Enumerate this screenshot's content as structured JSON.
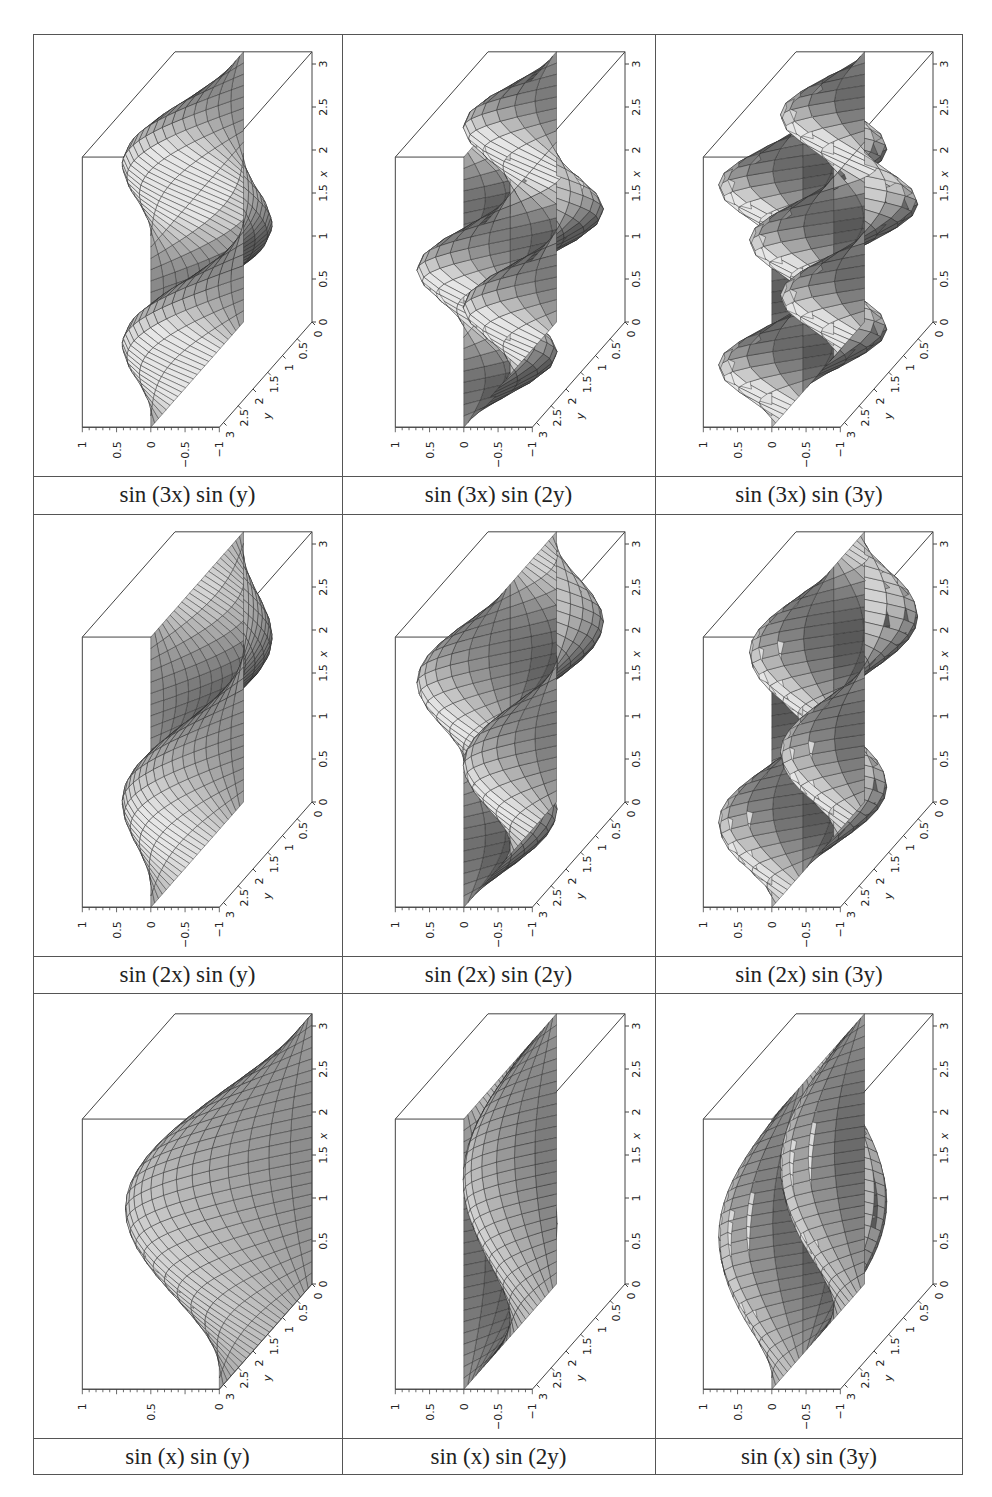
{
  "figure": {
    "layout": {
      "rows": 3,
      "cols": 3
    },
    "cells": [
      {
        "row": 0,
        "col": 0,
        "m": 3,
        "n": 1,
        "caption": "sin (3x) sin (y)",
        "zlim": [
          -1,
          1
        ]
      },
      {
        "row": 0,
        "col": 1,
        "m": 3,
        "n": 2,
        "caption": "sin (3x) sin (2y)",
        "zlim": [
          -1,
          1
        ]
      },
      {
        "row": 0,
        "col": 2,
        "m": 3,
        "n": 3,
        "caption": "sin (3x) sin (3y)",
        "zlim": [
          -1,
          1
        ]
      },
      {
        "row": 1,
        "col": 0,
        "m": 2,
        "n": 1,
        "caption": "sin (2x) sin (y)",
        "zlim": [
          -1,
          1
        ]
      },
      {
        "row": 1,
        "col": 1,
        "m": 2,
        "n": 2,
        "caption": "sin (2x) sin (2y)",
        "zlim": [
          -1,
          1
        ]
      },
      {
        "row": 1,
        "col": 2,
        "m": 2,
        "n": 3,
        "caption": "sin (2x) sin (3y)",
        "zlim": [
          -1,
          1
        ]
      },
      {
        "row": 2,
        "col": 0,
        "m": 1,
        "n": 1,
        "caption": "sin (x) sin (y)",
        "zlim": [
          0,
          1
        ]
      },
      {
        "row": 2,
        "col": 1,
        "m": 1,
        "n": 2,
        "caption": "sin (x) sin (2y)",
        "zlim": [
          -1,
          1
        ]
      },
      {
        "row": 2,
        "col": 2,
        "m": 1,
        "n": 3,
        "caption": "sin (x) sin (3y)",
        "zlim": [
          -1,
          1
        ]
      }
    ]
  },
  "chart_data": {
    "type": "surface-grid",
    "title": "",
    "function_family": "z = sin(m x) sin(n y)",
    "domain": {
      "x": [
        0,
        3.14159
      ],
      "y": [
        0,
        3.14159
      ]
    },
    "xlabel": "x",
    "ylabel": "y",
    "zlabel": "",
    "x_ticks": [
      "0",
      "0.5",
      "1",
      "1.5",
      "2",
      "2.5",
      "3"
    ],
    "y_ticks": [
      "0",
      "0.5",
      "1",
      "1.5",
      "2",
      "2.5",
      "3"
    ],
    "z_ticks_default": [
      "-1",
      "-0.5",
      "0",
      "0.5",
      "1"
    ],
    "z_ticks_sin_x_sin_y": [
      "0",
      "0.5",
      "1"
    ],
    "panels": [
      {
        "label": "sin (3x) sin (y)",
        "m": 3,
        "n": 1,
        "zlim": [
          -1,
          1
        ]
      },
      {
        "label": "sin (3x) sin (2y)",
        "m": 3,
        "n": 2,
        "zlim": [
          -1,
          1
        ]
      },
      {
        "label": "sin (3x) sin (3y)",
        "m": 3,
        "n": 3,
        "zlim": [
          -1,
          1
        ]
      },
      {
        "label": "sin (2x) sin (y)",
        "m": 2,
        "n": 1,
        "zlim": [
          -1,
          1
        ]
      },
      {
        "label": "sin (2x) sin (2y)",
        "m": 2,
        "n": 2,
        "zlim": [
          -1,
          1
        ]
      },
      {
        "label": "sin (2x) sin (3y)",
        "m": 2,
        "n": 3,
        "zlim": [
          -1,
          1
        ]
      },
      {
        "label": "sin (x) sin (y)",
        "m": 1,
        "n": 1,
        "zlim": [
          0,
          1
        ]
      },
      {
        "label": "sin (x) sin (2y)",
        "m": 1,
        "n": 2,
        "zlim": [
          -1,
          1
        ]
      },
      {
        "label": "sin (x) sin (3y)",
        "m": 1,
        "n": 3,
        "zlim": [
          -1,
          1
        ]
      }
    ],
    "grid": false,
    "legend": "none"
  }
}
